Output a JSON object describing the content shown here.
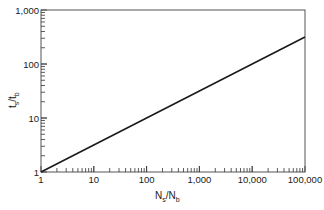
{
  "chart_data": {
    "type": "line",
    "title": "",
    "xlabel": "N_s/N_b",
    "ylabel": "t_s/t_b",
    "xlabel_parts": {
      "main1": "N",
      "sub1": "s",
      "slash": "/",
      "main2": "N",
      "sub2": "b"
    },
    "ylabel_parts": {
      "main1": "t",
      "sub1": "s",
      "slash": "/",
      "main2": "t",
      "sub2": "b"
    },
    "xscale": "log",
    "yscale": "log",
    "xlim": [
      1,
      100000
    ],
    "ylim": [
      1,
      1000
    ],
    "x_ticks": [
      {
        "value": 1,
        "label": "1"
      },
      {
        "value": 10,
        "label": "10"
      },
      {
        "value": 100,
        "label": "100"
      },
      {
        "value": 1000,
        "label": "1,000"
      },
      {
        "value": 10000,
        "label": "10,000"
      },
      {
        "value": 100000,
        "label": "100,000"
      }
    ],
    "y_ticks": [
      {
        "value": 1,
        "label": "1"
      },
      {
        "value": 10,
        "label": "10"
      },
      {
        "value": 100,
        "label": "100"
      },
      {
        "value": 1000,
        "label": "1,000"
      }
    ],
    "grid": false,
    "legend": null,
    "series": [
      {
        "name": "t_s/t_b = (N_s/N_b)^0.5",
        "x": [
          1,
          10,
          100,
          1000,
          10000,
          100000
        ],
        "y": [
          1,
          3.16,
          10,
          31.6,
          100,
          316
        ]
      }
    ]
  }
}
